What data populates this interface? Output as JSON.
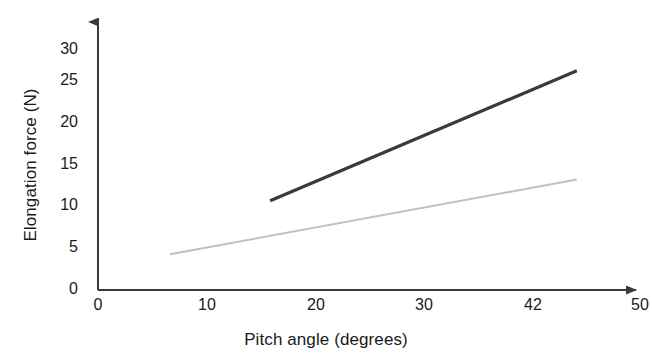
{
  "chart_data": {
    "type": "line",
    "title": "",
    "xlabel": "Pitch angle (degrees)",
    "ylabel": "Elongation force (N)",
    "xlim": [
      0,
      50
    ],
    "ylim": [
      0,
      33
    ],
    "grid": false,
    "legend": "none",
    "xticks": [
      {
        "label": "0",
        "value": 0
      },
      {
        "label": "10",
        "value": 10
      },
      {
        "label": "20",
        "value": 20
      },
      {
        "label": "30",
        "value": 30
      },
      {
        "label": "42",
        "value": 40
      },
      {
        "label": "50",
        "value": 50
      }
    ],
    "yticks": [
      {
        "label": "0",
        "value": 0
      },
      {
        "label": "5",
        "value": 5
      },
      {
        "label": "10",
        "value": 10
      },
      {
        "label": "15",
        "value": 15
      },
      {
        "label": "20",
        "value": 20
      },
      {
        "label": "25",
        "value": 25
      },
      {
        "label": "30",
        "value": 30
      }
    ],
    "series": [
      {
        "name": "upper-line",
        "color": "#3a3a3a",
        "width": 3.2,
        "x": [
          16.0,
          44.5
        ],
        "y": [
          11.0,
          27.0
        ]
      },
      {
        "name": "lower-line",
        "color": "#c0c0c0",
        "width": 2.0,
        "x": [
          6.7,
          44.5
        ],
        "y": [
          4.4,
          13.6
        ]
      }
    ],
    "axis_color": "#3a3a3a",
    "background": "#ffffff"
  }
}
